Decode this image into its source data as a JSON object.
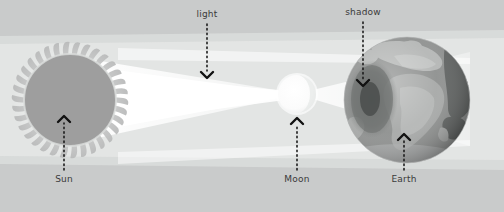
{
  "diagram": {
    "background_color": "#c9cbcb",
    "panel_color": "#cfd1d0",
    "labels": {
      "light": "light",
      "shadow": "shadow",
      "sun": "Sun",
      "moon": "Moon",
      "earth": "Earth"
    },
    "bodies": [
      {
        "name": "sun",
        "label": "Sun",
        "cx": 70,
        "cy": 100,
        "r": 46,
        "ray_r": 58,
        "color": "#9e9e9e",
        "ray_color": "#b9bbba"
      },
      {
        "name": "moon",
        "label": "Moon",
        "cx": 297,
        "cy": 94,
        "r": 19,
        "color": "#fdfdfd"
      },
      {
        "name": "earth",
        "label": "Earth",
        "cx": 407,
        "cy": 100,
        "r": 63,
        "ocean_color": "#8f9190",
        "land_color": "#b5b7b6",
        "dark_land_color": "#5f6261",
        "shadow_color": "#6e7170",
        "umbra_color": "#4a4d4c"
      }
    ],
    "light_beam": {
      "name": "light-beam",
      "color": "#fbfbfb",
      "band_color": "#e2e3e2"
    },
    "arrows": [
      {
        "name": "light-arrow",
        "label": "light",
        "x": 207,
        "label_y": 11,
        "from_y": 24,
        "to_y": 78,
        "direction": "down"
      },
      {
        "name": "shadow-arrow",
        "label": "shadow",
        "x": 363,
        "label_y": 9,
        "from_y": 22,
        "to_y": 86,
        "direction": "down"
      },
      {
        "name": "sun-arrow",
        "label": "Sun",
        "x": 64,
        "label_y": 175,
        "from_y": 170,
        "to_y": 116,
        "direction": "up"
      },
      {
        "name": "moon-arrow",
        "label": "Moon",
        "x": 297,
        "label_y": 175,
        "from_y": 170,
        "to_y": 118,
        "direction": "up"
      },
      {
        "name": "earth-arrow",
        "label": "Earth",
        "x": 404,
        "label_y": 175,
        "from_y": 170,
        "to_y": 134,
        "direction": "up"
      }
    ]
  }
}
